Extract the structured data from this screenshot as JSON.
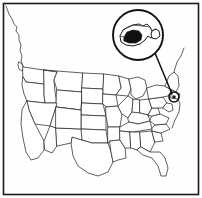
{
  "figure": {
    "background_color": "#fefefe",
    "frame_color": "#1a1a1a",
    "outline_color": "#2b2b2b",
    "highlight_color": "#111111",
    "width": 202,
    "height": 198
  },
  "frame": {
    "label": "map border frame",
    "x": 3,
    "y": 3,
    "width": 196,
    "height": 192
  },
  "basemap": {
    "label": "Contiguous United States state boundaries",
    "region": "Lower 48 states",
    "fill_color": "#ffffff",
    "stroke_color": "#2b2b2b"
  },
  "magnifier": {
    "label": "Magnified inset of Massachusetts",
    "shape": "circle",
    "center_x": 138,
    "center_y": 35,
    "radius": 25,
    "border_color": "#111111",
    "inset_subject": "Massachusetts",
    "highlight_label": "Highlighted area",
    "highlight_fill": "#111111"
  },
  "leader": {
    "label": "Leader line from magnifier to map location",
    "from_x": 155,
    "from_y": 53,
    "to_x": 172,
    "to_y": 95,
    "color": "#111111"
  },
  "target_marker": {
    "label": "Location marker on New England coast",
    "center_x": 174,
    "center_y": 97,
    "radius": 5,
    "color": "#111111"
  }
}
